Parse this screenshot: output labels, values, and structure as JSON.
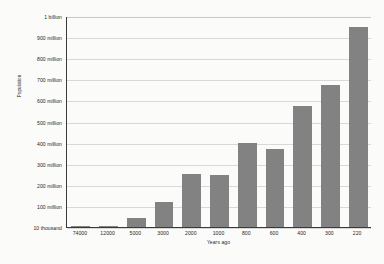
{
  "chart_data": {
    "type": "bar",
    "title": "",
    "xlabel": "Years ago",
    "ylabel": "Population",
    "categories": [
      "74000",
      "12000",
      "5000",
      "3000",
      "2000",
      "1000",
      "800",
      "600",
      "400",
      "300",
      "220"
    ],
    "values": [
      10000,
      2000000,
      45000000,
      120000000,
      250000000,
      248000000,
      400000000,
      370000000,
      575000000,
      675000000,
      950000000
    ],
    "value_labels": [
      "10 thousand",
      "2 million",
      "45 million",
      "120 million",
      "250 million",
      "248 million",
      "400 million",
      "370 million",
      "575 million",
      "675 million",
      "950 million"
    ],
    "ylim": [
      0,
      1000000000
    ],
    "ytick_values": [
      1000000000,
      900000000,
      800000000,
      700000000,
      600000000,
      500000000,
      400000000,
      300000000,
      200000000,
      100000000,
      10000
    ],
    "ytick_labels": [
      "1 billion",
      "900 million",
      "800 million",
      "700 million",
      "600 million",
      "500 million",
      "400 million",
      "300 million",
      "200 million",
      "100 million",
      "10 thousand"
    ],
    "grid": true,
    "legend": "none",
    "bar_color": "#828282",
    "gridline_color": "#d8d8d6",
    "axis_color": "#3a3a3a",
    "background_color": "#fbfbf9"
  }
}
